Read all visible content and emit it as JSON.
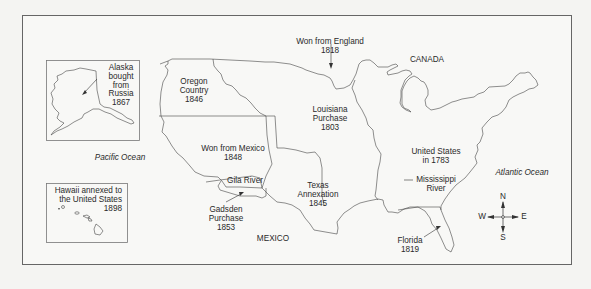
{
  "map": {
    "title": "Territorial Expansion of the United States",
    "colors": {
      "background": "#f4f4f2",
      "frame": "#666666",
      "lines": "#444444",
      "text": "#2a2a2a"
    },
    "regions": [
      {
        "id": "us-1783",
        "label": "United States\nin 1783"
      },
      {
        "id": "louisiana",
        "label": "Louisiana\nPurchase\n1803"
      },
      {
        "id": "england",
        "label": "Won from England\n1818"
      },
      {
        "id": "florida",
        "label": "Florida\n1819"
      },
      {
        "id": "texas",
        "label": "Texas\nAnnexation\n1845"
      },
      {
        "id": "oregon",
        "label": "Oregon\nCountry\n1846"
      },
      {
        "id": "mexico-cession",
        "label": "Won from Mexico\n1848"
      },
      {
        "id": "gadsden",
        "label": "Gadsden\nPurchase\n1853"
      }
    ],
    "insets": {
      "alaska": {
        "label": "Alaska\nbought\nfrom\nRussia\n1867"
      },
      "hawaii": {
        "label": "Hawaii annexed to\nthe United States\n1898"
      }
    },
    "features": {
      "gila_river": "Gila River",
      "mississippi_river": "Mississippi\nRiver",
      "canada": "CANADA",
      "mexico": "MEXICO",
      "pacific": "Pacific Ocean",
      "atlantic": "Atlantic Ocean"
    },
    "compass": {
      "n": "N",
      "s": "S",
      "e": "E",
      "w": "W"
    }
  }
}
